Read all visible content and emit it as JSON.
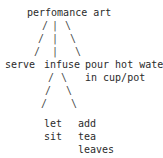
{
  "diagram": {
    "type": "ascii-tree",
    "title_text": "perfomance art",
    "colors": {
      "background": "#ffffff",
      "text": "#2b2b2b",
      "edge": "#4a4a4a"
    },
    "nodes": [
      {
        "id": "root",
        "label": "perfomance art",
        "x": 27,
        "y": 6,
        "level": 0
      },
      {
        "id": "serve",
        "label": "serve",
        "x": 5,
        "y": 58,
        "level": 1
      },
      {
        "id": "infuse",
        "label": "infuse",
        "x": 44,
        "y": 58,
        "level": 1
      },
      {
        "id": "pour",
        "label": "pour hot water",
        "x": 85,
        "y": 58,
        "level": 1
      },
      {
        "id": "pour2",
        "label": "in cup/pot",
        "x": 85,
        "y": 71,
        "level": 1
      },
      {
        "id": "let",
        "label": "let",
        "x": 44,
        "y": 117,
        "level": 2
      },
      {
        "id": "sit",
        "label": "sit",
        "x": 44,
        "y": 130,
        "level": 2
      },
      {
        "id": "add",
        "label": "add",
        "x": 78,
        "y": 117,
        "level": 2
      },
      {
        "id": "tea",
        "label": "tea",
        "x": 78,
        "y": 130,
        "level": 2
      },
      {
        "id": "leaves",
        "label": "leaves",
        "x": 78,
        "y": 143,
        "level": 2
      }
    ],
    "edges": [
      {
        "id": "root-serve-1",
        "glyph": "/",
        "x": 42,
        "y": 19
      },
      {
        "id": "root-serve-2",
        "glyph": "/",
        "x": 38,
        "y": 32
      },
      {
        "id": "root-serve-3",
        "glyph": "/",
        "x": 34,
        "y": 45
      },
      {
        "id": "root-infuse-1",
        "glyph": "|",
        "x": 52,
        "y": 19
      },
      {
        "id": "root-infuse-2",
        "glyph": "|",
        "x": 52,
        "y": 32
      },
      {
        "id": "root-infuse-3",
        "glyph": "|",
        "x": 52,
        "y": 45
      },
      {
        "id": "root-pour-1",
        "glyph": "\\",
        "x": 65,
        "y": 19
      },
      {
        "id": "root-pour-2",
        "glyph": "\\",
        "x": 70,
        "y": 32
      },
      {
        "id": "root-pour-3",
        "glyph": "\\",
        "x": 75,
        "y": 45
      },
      {
        "id": "infuse-let-1",
        "glyph": "/",
        "x": 48,
        "y": 71
      },
      {
        "id": "infuse-let-2",
        "glyph": "/",
        "x": 45,
        "y": 84
      },
      {
        "id": "infuse-let-3",
        "glyph": "/",
        "x": 41,
        "y": 97
      },
      {
        "id": "infuse-add-1",
        "glyph": "\\",
        "x": 61,
        "y": 71
      },
      {
        "id": "infuse-add-2",
        "glyph": "\\",
        "x": 66,
        "y": 84
      },
      {
        "id": "infuse-add-3",
        "glyph": "\\",
        "x": 71,
        "y": 97
      }
    ]
  }
}
